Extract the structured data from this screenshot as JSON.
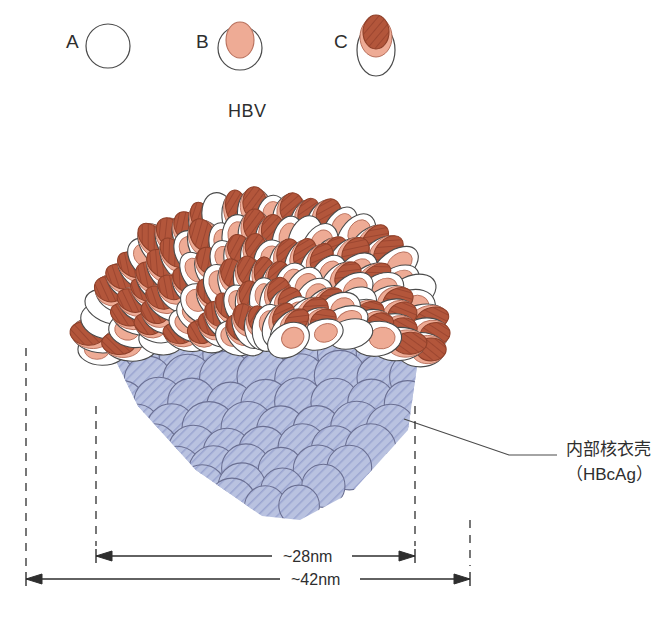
{
  "figure": {
    "title": "HBV",
    "background": "#ffffff",
    "stroke": "#3a3a3a"
  },
  "legend": {
    "items": [
      {
        "key": "A",
        "label": "A",
        "icon": "empty-circle-icon",
        "outer_fill": "#ffffff",
        "inner_fill": "none",
        "description": "empty spherical particle"
      },
      {
        "key": "B",
        "label": "B",
        "icon": "circle-with-salmon-core-icon",
        "outer_fill": "#ffffff",
        "inner_fill": "#eeab95",
        "description": "particle with light salmon inner body"
      },
      {
        "key": "C",
        "label": "C",
        "icon": "ellipse-with-dark-cap-icon",
        "outer_fill": "#ffffff",
        "inner_fill": "#b3563b",
        "description": "elongated particle with dark red-brown protruding cap"
      }
    ]
  },
  "colors": {
    "envelope_outer": "#ffffff",
    "envelope_outer_stroke": "#4a4a4a",
    "spike_light": "#eeab95",
    "spike_light_stroke": "#b8705c",
    "spike_dark": "#b3563b",
    "spike_dark_stroke": "#8e3f28",
    "capsid_fill": "#b4bddd",
    "capsid_hatch": "#8d98c8",
    "capsid_stroke": "#6a6f92",
    "line": "#2e2e2e",
    "text": "#2e2e2e"
  },
  "annotations": {
    "capsid_label_line1": "内部核衣壳",
    "capsid_label_line2": "（HBcAg）"
  },
  "dimensions": {
    "inner": {
      "value": "~28nm",
      "measures": "nucleocapsid core diameter"
    },
    "outer": {
      "value": "~42nm",
      "measures": "whole virion diameter"
    }
  },
  "chart_data": {
    "type": "diagram",
    "title": "HBV",
    "parts": [
      {
        "name": "outer envelope",
        "composition": "HBsAg surface particles",
        "fill": "#ffffff"
      },
      {
        "name": "inner nucleocapsid",
        "composition": "HBcAg",
        "fill": "#b4bddd"
      }
    ],
    "measurements": [
      {
        "label": "~28nm",
        "target": "inner nucleocapsid"
      },
      {
        "label": "~42nm",
        "target": "complete virion"
      }
    ]
  }
}
